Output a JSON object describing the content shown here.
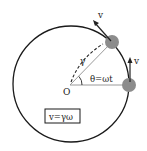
{
  "diagram": {
    "labels": {
      "origin": "O",
      "radius": "γ",
      "angle": "θ=ωt",
      "velocity_top": "v",
      "velocity_right": "v",
      "formula": "v=γω"
    },
    "colors": {
      "circle": "#1a1a1a",
      "particle": "#8c8c8c",
      "radius_line": "#9a9a9a",
      "arrow": "#222222"
    }
  }
}
